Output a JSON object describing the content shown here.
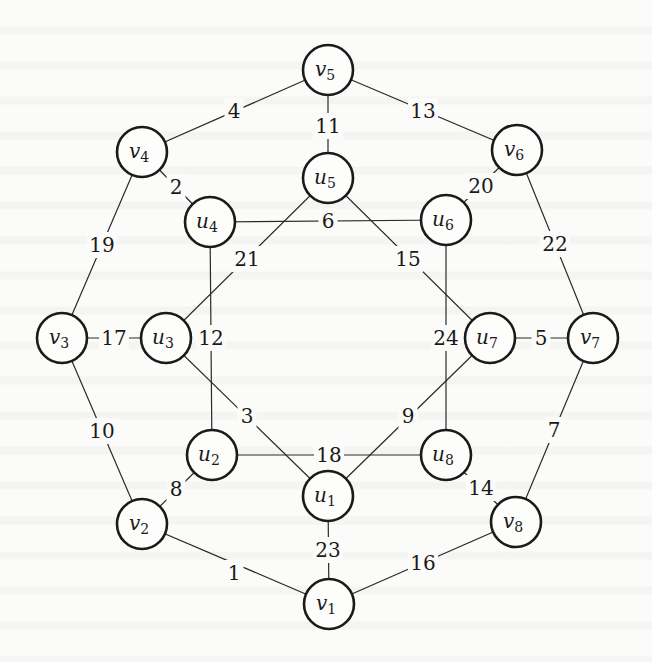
{
  "diagram": {
    "type": "weighted-undirected-graph",
    "node_radius": 25,
    "colors": {
      "stroke": "#1a1a1a",
      "edge": "#2a2a2a",
      "background": "#fbfbf9"
    },
    "nodes": [
      {
        "id": "v1",
        "base": "v",
        "sub": "1",
        "x": 329,
        "y": 604
      },
      {
        "id": "v2",
        "base": "v",
        "sub": "2",
        "x": 142,
        "y": 524
      },
      {
        "id": "v3",
        "base": "v",
        "sub": "3",
        "x": 62,
        "y": 338
      },
      {
        "id": "v4",
        "base": "v",
        "sub": "4",
        "x": 142,
        "y": 152
      },
      {
        "id": "v5",
        "base": "v",
        "sub": "5",
        "x": 328,
        "y": 70
      },
      {
        "id": "v6",
        "base": "v",
        "sub": "6",
        "x": 517,
        "y": 150
      },
      {
        "id": "v7",
        "base": "v",
        "sub": "7",
        "x": 593,
        "y": 338
      },
      {
        "id": "v8",
        "base": "v",
        "sub": "8",
        "x": 516,
        "y": 522
      },
      {
        "id": "u1",
        "base": "u",
        "sub": "1",
        "x": 328,
        "y": 496
      },
      {
        "id": "u2",
        "base": "u",
        "sub": "2",
        "x": 212,
        "y": 455
      },
      {
        "id": "u3",
        "base": "u",
        "sub": "3",
        "x": 166,
        "y": 338
      },
      {
        "id": "u4",
        "base": "u",
        "sub": "4",
        "x": 210,
        "y": 222
      },
      {
        "id": "u5",
        "base": "u",
        "sub": "5",
        "x": 328,
        "y": 178
      },
      {
        "id": "u6",
        "base": "u",
        "sub": "6",
        "x": 446,
        "y": 220
      },
      {
        "id": "u7",
        "base": "u",
        "sub": "7",
        "x": 490,
        "y": 338
      },
      {
        "id": "u8",
        "base": "u",
        "sub": "8",
        "x": 446,
        "y": 455
      }
    ],
    "edges": [
      {
        "from": "v2",
        "to": "v1",
        "weight": "1",
        "lx": 234,
        "ly": 573
      },
      {
        "from": "v4",
        "to": "u4",
        "weight": "2",
        "lx": 176,
        "ly": 187
      },
      {
        "from": "u3",
        "to": "u1",
        "weight": "3",
        "lx": 247,
        "ly": 416
      },
      {
        "from": "v4",
        "to": "v5",
        "weight": "4",
        "lx": 234,
        "ly": 111
      },
      {
        "from": "u7",
        "to": "v7",
        "weight": "5",
        "lx": 541,
        "ly": 338
      },
      {
        "from": "u4",
        "to": "u6",
        "weight": "6",
        "lx": 328,
        "ly": 221
      },
      {
        "from": "v7",
        "to": "v8",
        "weight": "7",
        "lx": 554,
        "ly": 430
      },
      {
        "from": "v2",
        "to": "u2",
        "weight": "8",
        "lx": 176,
        "ly": 489
      },
      {
        "from": "u7",
        "to": "u1",
        "weight": "9",
        "lx": 408,
        "ly": 416
      },
      {
        "from": "v3",
        "to": "v2",
        "weight": "10",
        "lx": 102,
        "ly": 431
      },
      {
        "from": "v5",
        "to": "u5",
        "weight": "11",
        "lx": 328,
        "ly": 126
      },
      {
        "from": "u4",
        "to": "u2",
        "weight": "12",
        "lx": 211,
        "ly": 338
      },
      {
        "from": "v5",
        "to": "v6",
        "weight": "13",
        "lx": 423,
        "ly": 111
      },
      {
        "from": "u8",
        "to": "v8",
        "weight": "14",
        "lx": 481,
        "ly": 488
      },
      {
        "from": "u5",
        "to": "u7",
        "weight": "15",
        "lx": 408,
        "ly": 259
      },
      {
        "from": "v8",
        "to": "v1",
        "weight": "16",
        "lx": 423,
        "ly": 563
      },
      {
        "from": "v3",
        "to": "u3",
        "weight": "17",
        "lx": 114,
        "ly": 338
      },
      {
        "from": "u2",
        "to": "u8",
        "weight": "18",
        "lx": 329,
        "ly": 455
      },
      {
        "from": "v4",
        "to": "v3",
        "weight": "19",
        "lx": 102,
        "ly": 245
      },
      {
        "from": "v6",
        "to": "u6",
        "weight": "20",
        "lx": 481,
        "ly": 186
      },
      {
        "from": "u5",
        "to": "u3",
        "weight": "21",
        "lx": 247,
        "ly": 259
      },
      {
        "from": "v6",
        "to": "v7",
        "weight": "22",
        "lx": 555,
        "ly": 244
      },
      {
        "from": "u1",
        "to": "v1",
        "weight": "23",
        "lx": 328,
        "ly": 550
      },
      {
        "from": "u6",
        "to": "u8",
        "weight": "24",
        "lx": 446,
        "ly": 338
      }
    ]
  }
}
